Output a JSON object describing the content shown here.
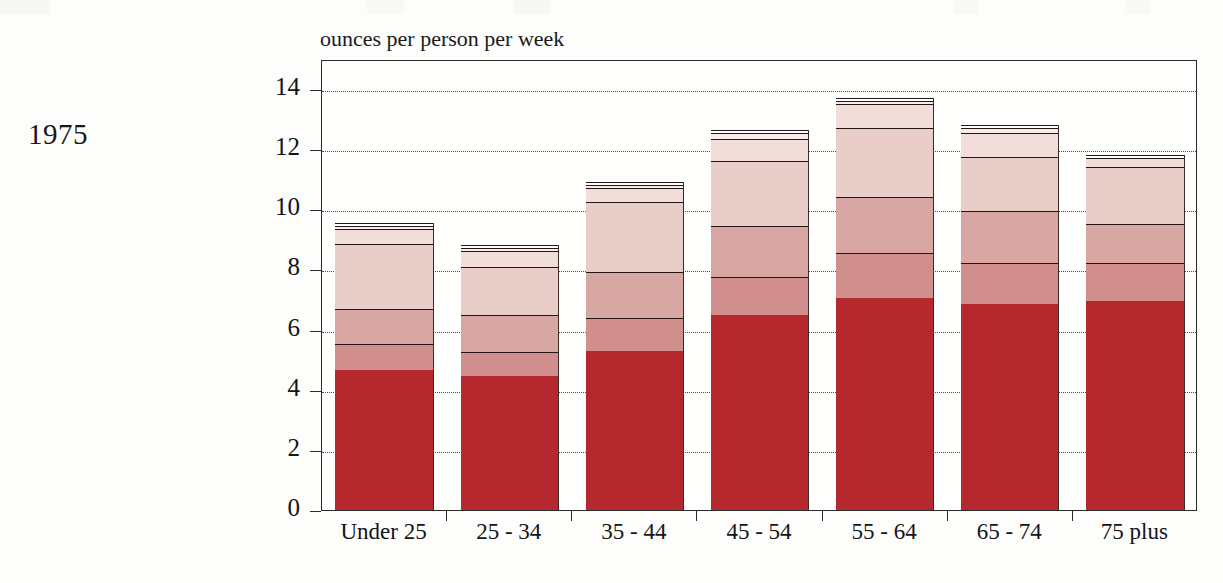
{
  "year_label": "1975",
  "chart_data": {
    "type": "bar",
    "subtype": "stacked-bar",
    "title": "",
    "axis_title": "ounces per person per week",
    "xlabel": "",
    "ylabel": "ounces per person per week",
    "ylim": [
      0,
      14.5
    ],
    "yticks": [
      0,
      2,
      4,
      6,
      8,
      10,
      12,
      14
    ],
    "ytick_labels": [
      "0",
      "2",
      "4",
      "6",
      "8",
      "10",
      "12",
      "14"
    ],
    "grid": true,
    "legend": "none",
    "categories": [
      "Under 25",
      "25 - 34",
      "35 - 44",
      "45 - 54",
      "55 - 64",
      "65 - 74",
      "75 plus"
    ],
    "series": [
      {
        "name": "segment-1",
        "color": "#b5282e",
        "values": [
          4.65,
          4.45,
          5.3,
          6.5,
          7.05,
          6.85,
          6.95
        ]
      },
      {
        "name": "segment-2",
        "color": "#d08f8d",
        "values": [
          0.87,
          0.8,
          1.1,
          1.25,
          1.5,
          1.35,
          1.25
        ]
      },
      {
        "name": "segment-3",
        "color": "#d9a7a3",
        "values": [
          1.18,
          1.23,
          1.5,
          1.7,
          1.85,
          1.75,
          1.3
        ]
      },
      {
        "name": "segment-4",
        "color": "#e8cdc8",
        "values": [
          2.15,
          1.6,
          2.35,
          2.15,
          2.3,
          1.8,
          1.9
        ]
      },
      {
        "name": "segment-5",
        "color": "#f1dedb",
        "values": [
          0.5,
          0.52,
          0.45,
          0.75,
          0.8,
          0.8,
          0.3
        ]
      },
      {
        "name": "segment-6",
        "color": "#f7ecea",
        "values": [
          0.1,
          0.1,
          0.1,
          0.2,
          0.1,
          0.15,
          0.0
        ]
      },
      {
        "name": "segment-7",
        "color": "#ffffff",
        "values": [
          0.1,
          0.1,
          0.1,
          0.1,
          0.1,
          0.1,
          0.1
        ]
      }
    ],
    "totals": [
      9.55,
      8.8,
      10.9,
      12.65,
      13.7,
      12.8,
      11.8
    ]
  }
}
